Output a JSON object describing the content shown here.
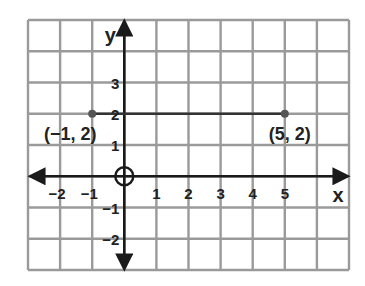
{
  "chart_data": {
    "type": "line",
    "title": "",
    "xlabel": "x",
    "ylabel": "y",
    "xlim": [
      -3,
      7
    ],
    "ylim": [
      -3,
      5
    ],
    "grid": true,
    "x_ticks": [
      -2,
      -1,
      1,
      2,
      3,
      4,
      5
    ],
    "x_tick_labels": [
      "−2",
      "−1",
      "1",
      "2",
      "3",
      "4",
      "5"
    ],
    "y_ticks": [
      3,
      2,
      1,
      -1,
      -2
    ],
    "y_tick_labels": [
      "3",
      "2",
      "1",
      "−1",
      "−2"
    ],
    "origin_marker": "circle",
    "series": [
      {
        "name": "segment",
        "points": [
          [
            -1,
            2
          ],
          [
            5,
            2
          ]
        ]
      }
    ],
    "points": [
      {
        "x": -1,
        "y": 2,
        "label": "(−1, 2)"
      },
      {
        "x": 5,
        "y": 2,
        "label": "(5, 2)"
      }
    ],
    "colors": {
      "grid": "#9a9a9a",
      "axis": "#1a1a1a",
      "segment": "#333333",
      "point": "#555555"
    }
  }
}
